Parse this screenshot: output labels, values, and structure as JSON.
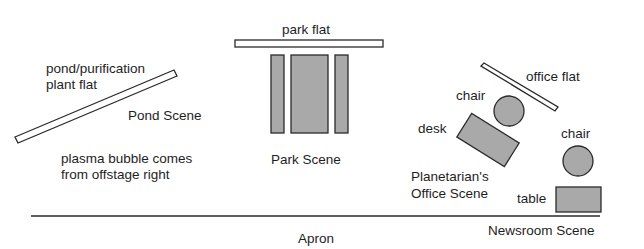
{
  "diagram": {
    "colors": {
      "fill_gray": "#a9a9a9",
      "outline": "#2a2a2a",
      "flat_fill": "#ffffff",
      "text": "#1e1e1e"
    },
    "scenes": {
      "pond": {
        "name": "Pond Scene",
        "flat_label_line1": "pond/purification",
        "flat_label_line2": "plant flat",
        "note_line1": "plasma bubble comes",
        "note_line2": "from offstage right"
      },
      "park": {
        "name": "Park Scene",
        "flat_label": "park flat"
      },
      "office": {
        "name_line1": "Planetarian's",
        "name_line2": "Office Scene",
        "flat_label": "office flat",
        "chair_label": "chair",
        "desk_label": "desk"
      },
      "newsroom": {
        "name": "Newsroom Scene",
        "chair_label": "chair",
        "table_label": "table"
      }
    },
    "apron_label": "Apron"
  }
}
